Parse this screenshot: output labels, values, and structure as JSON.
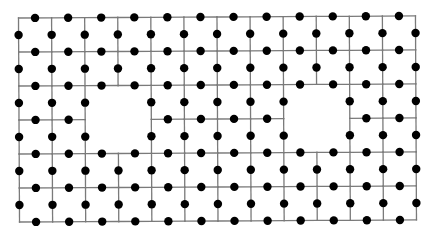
{
  "diagram": {
    "type": "lattice-with-holes",
    "grid": {
      "columns": 12,
      "rows": 6,
      "origin": [
        18.5,
        18
      ],
      "column_vector": [
        33.08,
        -0.17
      ],
      "row_vector": [
        0.17,
        34.0
      ]
    },
    "holes": [
      {
        "name": "left-hole",
        "col_start": 2,
        "row_start": 2,
        "cols": 2,
        "rows": 2
      },
      {
        "name": "right-hole",
        "col_start": 8,
        "row_start": 2,
        "cols": 2,
        "rows": 2
      }
    ],
    "colors": {
      "background": "#ffffff",
      "edge": "#7a7a7a",
      "dot": "#000000"
    },
    "dot_radius": 4.2
  }
}
